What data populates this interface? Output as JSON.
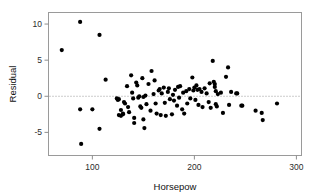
{
  "figure": {
    "name": "residual-vs-horsepower-scatterplot",
    "background_color": "#ffffff",
    "point_color": "#000000",
    "frame_color": "#9a9a9a",
    "reference_line_color": "#8d8d8d"
  },
  "chart_data": {
    "type": "scatter",
    "title": "",
    "subtitle": "",
    "xlabel": "Horsepow",
    "ylabel": "Residual",
    "xlim": [
      57,
      305
    ],
    "ylim": [
      -8.2,
      11.6
    ],
    "xticks": [
      100,
      200,
      300
    ],
    "xtick_labels": [
      "100",
      "200",
      "300"
    ],
    "yticks": [
      10,
      5,
      0,
      -5
    ],
    "ytick_labels": [
      "10",
      "5",
      "0",
      "-5"
    ],
    "grid": false,
    "legend": null,
    "legend_position": "none",
    "annotations": [
      {
        "name": "zero-reference-line",
        "kind": "horizontal-dotted-line",
        "y": 0
      }
    ],
    "marker": {
      "shape": "circle",
      "size_px": 2.1,
      "color": "#000000"
    },
    "series": [
      {
        "name": "residuals",
        "points": [
          [
            70,
            6.4
          ],
          [
            88,
            10.3
          ],
          [
            107,
            8.5
          ],
          [
            88,
            -1.8
          ],
          [
            100,
            -1.8
          ],
          [
            107,
            -4.5
          ],
          [
            89,
            -6.6
          ],
          [
            113,
            2.3
          ],
          [
            124,
            -0.3
          ],
          [
            125,
            -0.5
          ],
          [
            126,
            -0.4
          ],
          [
            126,
            -2.6
          ],
          [
            128,
            -2.7
          ],
          [
            128,
            -1.9
          ],
          [
            130,
            -2.4
          ],
          [
            130,
            -2.5
          ],
          [
            131,
            -0.8
          ],
          [
            132,
            -1.0
          ],
          [
            134,
            1.4
          ],
          [
            135,
            -1.5
          ],
          [
            136,
            -2.2
          ],
          [
            138,
            2.9
          ],
          [
            139,
            0.5
          ],
          [
            140,
            -0.3
          ],
          [
            141,
            -3.0
          ],
          [
            141,
            -3.7
          ],
          [
            143,
            1.9
          ],
          [
            144,
            1.5
          ],
          [
            145,
            -0.2
          ],
          [
            146,
            0.0
          ],
          [
            147,
            -1.4
          ],
          [
            148,
            -1.6
          ],
          [
            149,
            2.5
          ],
          [
            150,
            -0.1
          ],
          [
            150,
            -3.2
          ],
          [
            151,
            -4.4
          ],
          [
            152,
            0.1
          ],
          [
            153,
            -1.1
          ],
          [
            155,
            1.7
          ],
          [
            157,
            -2.0
          ],
          [
            158,
            3.5
          ],
          [
            160,
            0.3
          ],
          [
            161,
            2.2
          ],
          [
            162,
            -1.0
          ],
          [
            163,
            -2.4
          ],
          [
            165,
            0.8
          ],
          [
            166,
            1.0
          ],
          [
            167,
            -2.6
          ],
          [
            168,
            0.4
          ],
          [
            170,
            1.2
          ],
          [
            171,
            -0.9
          ],
          [
            172,
            -2.7
          ],
          [
            174,
            0.6
          ],
          [
            175,
            1.1
          ],
          [
            176,
            -0.4
          ],
          [
            178,
            -2.5
          ],
          [
            179,
            0.2
          ],
          [
            180,
            -0.6
          ],
          [
            181,
            0.9
          ],
          [
            183,
            -1.3
          ],
          [
            184,
            1.3
          ],
          [
            185,
            -0.2
          ],
          [
            186,
            1.4
          ],
          [
            188,
            -1.8
          ],
          [
            189,
            0.5
          ],
          [
            190,
            -2.4
          ],
          [
            192,
            0.7
          ],
          [
            193,
            -1.0
          ],
          [
            195,
            1.0
          ],
          [
            196,
            -0.3
          ],
          [
            198,
            2.6
          ],
          [
            199,
            0.8
          ],
          [
            200,
            1.2
          ],
          [
            201,
            -0.5
          ],
          [
            202,
            1.5
          ],
          [
            203,
            0.9
          ],
          [
            204,
            -1.2
          ],
          [
            205,
            1.0
          ],
          [
            207,
            0.6
          ],
          [
            208,
            -1.5
          ],
          [
            210,
            1.1
          ],
          [
            212,
            0.4
          ],
          [
            214,
            -0.8
          ],
          [
            215,
            1.8
          ],
          [
            216,
            -1.6
          ],
          [
            218,
            4.9
          ],
          [
            219,
            2.0
          ],
          [
            220,
            1.7
          ],
          [
            220,
            1.3
          ],
          [
            221,
            0.7
          ],
          [
            221,
            -1.1
          ],
          [
            222,
            -1.4
          ],
          [
            223,
            0.3
          ],
          [
            226,
            0.5
          ],
          [
            228,
            -2.3
          ],
          [
            231,
            2.7
          ],
          [
            233,
            4.0
          ],
          [
            234,
            -1.2
          ],
          [
            236,
            0.6
          ],
          [
            241,
            0.4
          ],
          [
            242,
            0.4
          ],
          [
            246,
            -1.3
          ],
          [
            247,
            -1.3
          ],
          [
            260,
            -2.0
          ],
          [
            266,
            -2.3
          ],
          [
            267,
            -3.3
          ],
          [
            281,
            -1.0
          ]
        ]
      }
    ]
  }
}
